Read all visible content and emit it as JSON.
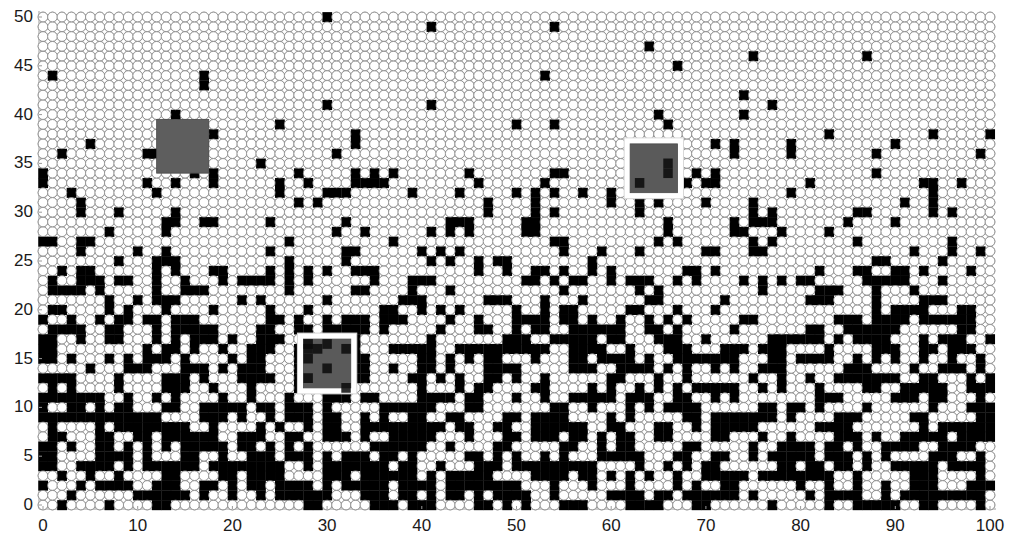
{
  "chart_data": {
    "type": "heatmap",
    "title": "",
    "xlabel": "",
    "ylabel": "",
    "xlim": [
      0,
      100
    ],
    "ylim": [
      0,
      50
    ],
    "grid": false,
    "legend": null,
    "x_ticks": [
      0,
      10,
      20,
      30,
      40,
      50,
      60,
      70,
      80,
      90,
      100
    ],
    "y_ticks": [
      0,
      5,
      10,
      15,
      20,
      25,
      30,
      35,
      40,
      45,
      50
    ],
    "x_tick_labels": [
      "0",
      "10",
      "20",
      "30",
      "40",
      "50",
      "60",
      "70",
      "80",
      "90",
      "100"
    ],
    "y_tick_labels": [
      "0",
      "5",
      "10",
      "15",
      "20",
      "25",
      "30",
      "35",
      "40",
      "45",
      "50"
    ],
    "lattice": {
      "columns": 101,
      "rows": 51,
      "site_shape": "circle",
      "occupied_color": "#000000",
      "empty_color": "#ffffff",
      "site_outline_color": "#8a8a8a"
    },
    "occupancy_density_by_height": [
      {
        "y_range": [
          0,
          10
        ],
        "approx_fraction_occupied": 0.38
      },
      {
        "y_range": [
          10,
          20
        ],
        "approx_fraction_occupied": 0.32
      },
      {
        "y_range": [
          20,
          25
        ],
        "approx_fraction_occupied": 0.24
      },
      {
        "y_range": [
          25,
          30
        ],
        "approx_fraction_occupied": 0.16
      },
      {
        "y_range": [
          30,
          35
        ],
        "approx_fraction_occupied": 0.11
      },
      {
        "y_range": [
          35,
          40
        ],
        "approx_fraction_occupied": 0.07
      },
      {
        "y_range": [
          40,
          50
        ],
        "approx_fraction_occupied": 0.02
      }
    ],
    "highlighted_regions": [
      {
        "id": "A",
        "x_range": [
          12,
          17.5
        ],
        "y_range": [
          34,
          39.5
        ],
        "fill": "#5e5e5e",
        "white_border": false,
        "contains_occupied_sites": false
      },
      {
        "id": "B",
        "x_range": [
          27.5,
          32.5
        ],
        "y_range": [
          12,
          17
        ],
        "fill": "#5a5a5a",
        "white_border": true,
        "contains_occupied_sites": true
      },
      {
        "id": "C",
        "x_range": [
          62,
          67
        ],
        "y_range": [
          32,
          37
        ],
        "fill": "#5a5a5a",
        "white_border": true,
        "contains_occupied_sites": true
      }
    ]
  },
  "axes": {
    "origin_px": [
      43,
      505
    ],
    "x_max_px": 990,
    "y_max_px": 17,
    "axis_color": "#9a9a9a"
  },
  "render": {
    "seed": 20240517
  }
}
